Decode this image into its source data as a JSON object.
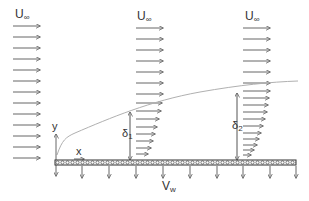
{
  "diagram": {
    "colors": {
      "arrow": "#666666",
      "plate_border": "#333333",
      "plate_fill": "#9a9a9a",
      "boundary_curve": "#b0b0b0",
      "text": "#333333"
    },
    "labels": {
      "freestream_1": {
        "main": "U",
        "sub": "∞"
      },
      "freestream_2": {
        "main": "U",
        "sub": "∞"
      },
      "freestream_3": {
        "main": "U",
        "sub": "∞"
      },
      "y_axis": "y",
      "x_axis": "x",
      "delta_1": {
        "main": "δ",
        "sub": "1"
      },
      "delta_2": {
        "main": "δ",
        "sub": "2"
      },
      "suction": {
        "main": "V",
        "sub": "w"
      }
    },
    "profiles": [
      {
        "name": "inlet-uniform",
        "x_start": 13,
        "arrow_count": 13,
        "y_top": 26,
        "spacing": 11,
        "lengths": [
          27,
          27,
          27,
          27,
          27,
          27,
          27,
          27,
          27,
          27,
          27,
          27,
          27
        ]
      },
      {
        "name": "profile-1",
        "x_start": 136,
        "arrow_count": 18,
        "lengths": [
          27,
          27,
          27,
          27,
          27,
          27,
          27,
          27,
          26,
          24,
          21,
          19,
          17,
          15,
          12,
          9,
          6
        ]
      },
      {
        "name": "profile-2",
        "x_start": 242,
        "arrow_count": 18,
        "lengths": [
          27,
          27,
          27,
          27,
          27,
          27,
          27,
          26,
          24,
          22,
          20,
          18,
          16,
          14,
          12,
          9,
          6,
          3
        ]
      }
    ],
    "plate": {
      "x": 55,
      "y": 160,
      "width": 241,
      "height": 5
    },
    "suction_arrow_x": [
      55,
      82,
      109,
      136,
      163,
      190,
      217,
      243,
      270,
      296
    ]
  }
}
